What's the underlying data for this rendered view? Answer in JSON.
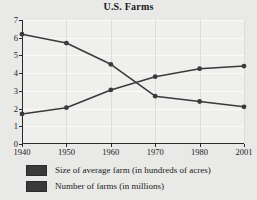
{
  "chart_data": {
    "type": "line",
    "title": "U.S. Farms",
    "xlabel": "",
    "ylabel": "",
    "x": [
      "1940",
      "1950",
      "1960",
      "1970",
      "1980",
      "2001"
    ],
    "ylim": [
      0,
      7
    ],
    "yticks": [
      "0",
      "1",
      "2",
      "3",
      "4",
      "5",
      "6",
      "7"
    ],
    "grid": true,
    "legend_position": "bottom-left",
    "series": [
      {
        "name": "Size of average farm (in hundreds of acres)",
        "values": [
          1.7,
          2.05,
          3.05,
          3.8,
          4.25,
          4.4
        ],
        "color": "#3a3a3a",
        "marker": "circle"
      },
      {
        "name": "Number of farms (in millions)",
        "values": [
          6.2,
          5.7,
          4.5,
          2.7,
          2.4,
          2.1
        ],
        "color": "#3a3a3a",
        "marker": "circle"
      }
    ]
  },
  "legend": {
    "items": [
      {
        "label": "Size of average farm (in hundreds of acres)",
        "swatch": "#3a3a3a"
      },
      {
        "label": "Number of farms (in millions)",
        "swatch": "#3a3a3a"
      }
    ]
  }
}
